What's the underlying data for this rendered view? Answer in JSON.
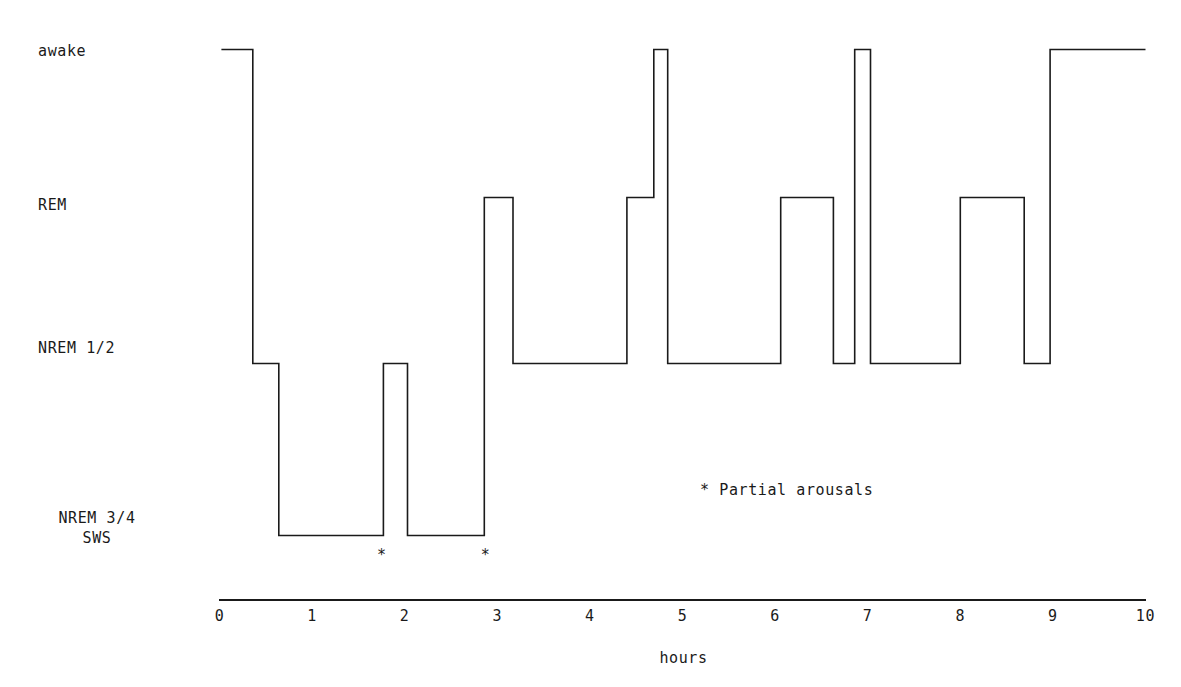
{
  "chart_data": {
    "type": "line",
    "title": "",
    "xlabel": "hours",
    "ylabel": "",
    "xlim": [
      0,
      10
    ],
    "grid": false,
    "legend_position": "inside-right",
    "stage_axis": {
      "categories": [
        "awake",
        "REM",
        "NREM 1/2",
        "NREM 3/4 SWS"
      ],
      "tick_labels": [
        {
          "line1": "awake",
          "line2": ""
        },
        {
          "line1": "REM",
          "line2": ""
        },
        {
          "line1": "NREM 1/2",
          "line2": ""
        },
        {
          "line1": "NREM 3/4",
          "line2": "SWS"
        }
      ]
    },
    "x_tick_labels": [
      "0",
      "1",
      "2",
      "3",
      "4",
      "5",
      "6",
      "7",
      "8",
      "9",
      "10"
    ],
    "x_tick_values": [
      0,
      1,
      2,
      3,
      4,
      5,
      6,
      7,
      8,
      9,
      10
    ],
    "series": [
      {
        "name": "sleep stage",
        "color": "#1a1a1a",
        "step": "post",
        "segments": [
          {
            "stage": "awake",
            "start": 0.02,
            "end": 0.36
          },
          {
            "stage": "NREM 1/2",
            "start": 0.36,
            "end": 0.64
          },
          {
            "stage": "NREM 3/4 SWS",
            "start": 0.64,
            "end": 1.77
          },
          {
            "stage": "NREM 1/2",
            "start": 1.77,
            "end": 2.03
          },
          {
            "stage": "NREM 3/4 SWS",
            "start": 2.03,
            "end": 2.86
          },
          {
            "stage": "REM",
            "start": 2.86,
            "end": 3.17
          },
          {
            "stage": "NREM 1/2",
            "start": 3.17,
            "end": 4.4
          },
          {
            "stage": "REM",
            "start": 4.4,
            "end": 4.69
          },
          {
            "stage": "awake",
            "start": 4.69,
            "end": 4.84
          },
          {
            "stage": "NREM 1/2",
            "start": 4.84,
            "end": 6.06
          },
          {
            "stage": "REM",
            "start": 6.06,
            "end": 6.63
          },
          {
            "stage": "NREM 1/2",
            "start": 6.63,
            "end": 6.86
          },
          {
            "stage": "awake",
            "start": 6.86,
            "end": 7.03
          },
          {
            "stage": "NREM 1/2",
            "start": 7.03,
            "end": 8.0
          },
          {
            "stage": "REM",
            "start": 8.0,
            "end": 8.69
          },
          {
            "stage": "NREM 1/2",
            "start": 8.69,
            "end": 8.97
          },
          {
            "stage": "awake",
            "start": 8.97,
            "end": 10.0
          }
        ]
      }
    ],
    "annotations": [
      {
        "marker": "*",
        "x": 1.75,
        "label": "partial arousal"
      },
      {
        "marker": "*",
        "x": 2.87,
        "label": "partial arousal"
      }
    ],
    "legend": [
      {
        "marker": "*",
        "text": "* Partial arousals"
      }
    ]
  },
  "labels": {
    "awake": "awake",
    "rem": "REM",
    "nrem12": "NREM 1/2",
    "nrem34": "NREM 3/4",
    "sws": "SWS",
    "legend_note": "* Partial arousals",
    "axis_title": "hours"
  },
  "colors": {
    "trace": "#1a1a1a",
    "axis": "#1a1a1a",
    "background": "#ffffff"
  }
}
